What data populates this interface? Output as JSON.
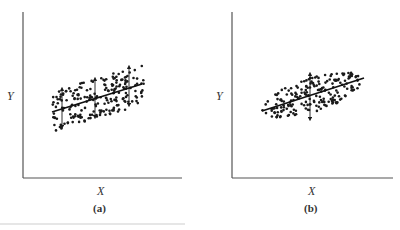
{
  "chart_data": [
    {
      "type": "scatter",
      "panel_label": "(a)",
      "xlabel": "X",
      "ylabel": "Y",
      "title": "",
      "grid": false,
      "legend": null,
      "annotations": [
        "fitted regression line",
        "vertical double-headed arrows showing conditional spread of Y at three X values (spread roughly constant but cloud parallelogram-shaped)"
      ],
      "regression_line": {
        "x": [
          0.18,
          0.75
        ],
        "y": [
          0.4,
          0.57
        ]
      },
      "arrows": [
        {
          "x": 0.25,
          "y_low": 0.3,
          "y_high": 0.54
        },
        {
          "x": 0.46,
          "y_low": 0.36,
          "y_high": 0.6
        },
        {
          "x": 0.67,
          "y_low": 0.43,
          "y_high": 0.67
        }
      ],
      "xlim": [
        0,
        1
      ],
      "ylim": [
        0,
        1
      ],
      "point_cloud": {
        "shape": "parallelogram band",
        "x_range": [
          0.18,
          0.76
        ],
        "y_range": [
          0.3,
          0.67
        ],
        "approx_points": 200
      }
    },
    {
      "type": "scatter",
      "panel_label": "(b)",
      "xlabel": "X",
      "ylabel": "Y",
      "title": "",
      "grid": false,
      "legend": null,
      "annotations": [
        "fitted regression line",
        "single vertical double-headed arrow at center of elliptical cloud"
      ],
      "regression_line": {
        "x": [
          0.19,
          0.81
        ],
        "y": [
          0.4,
          0.6
        ]
      },
      "arrows": [
        {
          "x": 0.48,
          "y_low": 0.35,
          "y_high": 0.63
        }
      ],
      "xlim": [
        0,
        1
      ],
      "ylim": [
        0,
        1
      ],
      "point_cloud": {
        "shape": "tilted ellipse",
        "x_range": [
          0.18,
          0.82
        ],
        "y_range": [
          0.35,
          0.65
        ],
        "approx_points": 200
      }
    }
  ],
  "panels": {
    "a": {
      "xlabel": "X",
      "ylabel": "Y",
      "caption": "(a)"
    },
    "b": {
      "xlabel": "X",
      "ylabel": "Y",
      "caption": "(b)"
    }
  }
}
